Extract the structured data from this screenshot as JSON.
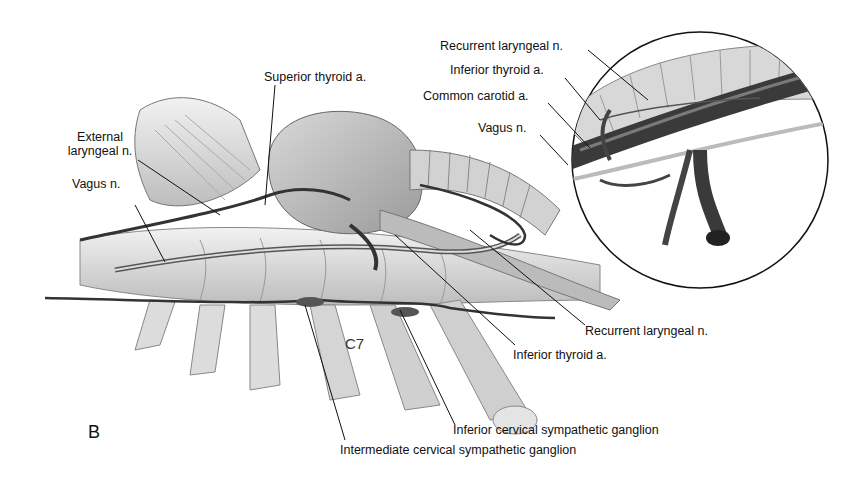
{
  "figure": {
    "panel_label": "B",
    "vertebra_label": "C7",
    "signature": "J. Sylvester Stonich '80"
  },
  "labels": {
    "superior_thyroid": "Superior thyroid a.",
    "external_laryngeal_1": "External",
    "external_laryngeal_2": "laryngeal n.",
    "vagus_left": "Vagus n.",
    "inset_recurrent_laryngeal": "Recurrent laryngeal n.",
    "inset_inferior_thyroid": "Inferior thyroid a.",
    "inset_common_carotid": "Common carotid a.",
    "inset_vagus": "Vagus n.",
    "recurrent_laryngeal": "Recurrent laryngeal n.",
    "inferior_thyroid": "Inferior thyroid a.",
    "inferior_ganglion": "Inferior cervical sympathetic ganglion",
    "intermediate_ganglion": "Intermediate cervical sympathetic ganglion"
  },
  "colors": {
    "background": "#ffffff",
    "ink": "#111111",
    "vessel": "#3a3a3a",
    "tissue": "#cfcfcf"
  }
}
